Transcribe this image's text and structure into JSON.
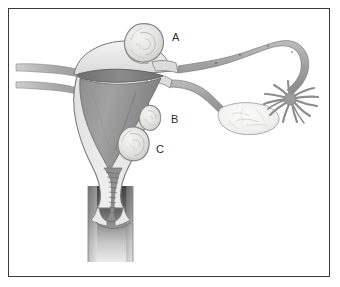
{
  "figure": {
    "background_color": "#ffffff",
    "frame_color": "#3a3a3a"
  },
  "labels": [
    {
      "id": "label-a",
      "text": "A",
      "x": 172,
      "y": 41,
      "refers_to": "subserosal-fibroid"
    },
    {
      "id": "label-b",
      "text": "B",
      "x": 171,
      "y": 123,
      "refers_to": "intramural-fibroid"
    },
    {
      "id": "label-c",
      "text": "C",
      "x": 156,
      "y": 153,
      "refers_to": "submucosal-fibroid"
    }
  ],
  "structures": {
    "uterus_body": "uterus-myometrium",
    "uterine_cavity": "endometrial-cavity",
    "cervix": "cervix",
    "cervical_canal": "cervical-canal",
    "vagina": "vagina",
    "fallopian_tube_right": "fallopian-tube",
    "fimbriae": "fimbriae",
    "ovary": "ovary",
    "ligament_upper_left": "round-ligament-left",
    "ligament_lower_left": "broad-ligament-left",
    "fibroid_a": "subserosal-fibroid",
    "fibroid_b": "intramural-fibroid",
    "fibroid_c": "submucosal-fibroid"
  },
  "colors": {
    "outline": "#6b6b6b",
    "outline_dark": "#555555",
    "myometrium_light": "#eaeaea",
    "myometrium_mid": "#d6d6d6",
    "cavity_dark": "#8a8a8a",
    "cavity_darker": "#6e6e6e",
    "tube_gray": "#a8a8a8",
    "fibroid_fill": "#e4e4e2",
    "ovary_fill": "#f2f2f0",
    "vagina_dark": "#4a4a4a",
    "label_color": "#2e2e2e"
  }
}
